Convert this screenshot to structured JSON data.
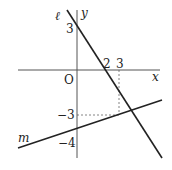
{
  "diagram": {
    "type": "coordinate-plane",
    "axes": {
      "x_label": "x",
      "y_label": "y",
      "origin_label": "O"
    },
    "lines": [
      {
        "name": "ℓ",
        "x_intercept": 2,
        "y_intercept": 3
      },
      {
        "name": "m",
        "y_intercept": -4
      }
    ],
    "tick_labels": {
      "x_2": "2",
      "x_3": "3",
      "y_3": "3",
      "y_neg3": "−3",
      "y_neg4": "−4"
    },
    "guides": [
      {
        "from": "(3,0)",
        "to": "(3,-3)",
        "style": "dotted"
      },
      {
        "from": "(0,-3)",
        "to": "(3,-3)",
        "style": "dotted"
      }
    ],
    "colors": {
      "line": "#222222",
      "axis": "#555555",
      "guide": "#666666"
    }
  }
}
